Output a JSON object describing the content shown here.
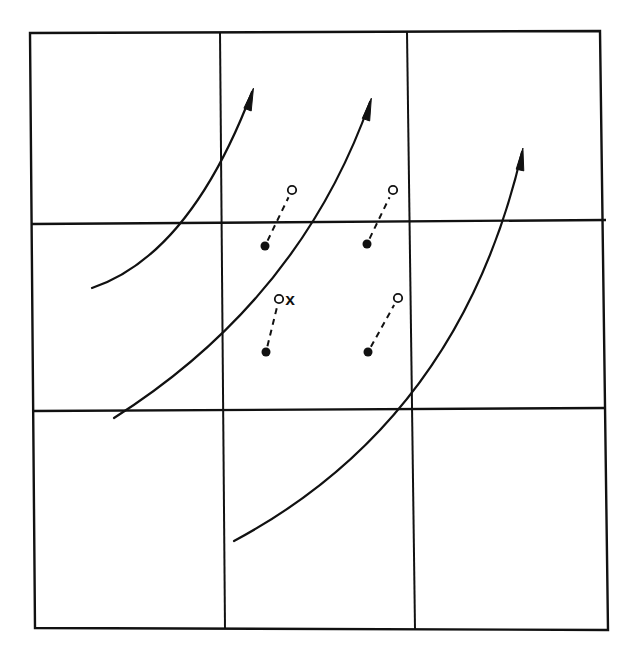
{
  "diagram": {
    "type": "grid-flow-displacement",
    "colors": {
      "ink": "#111111",
      "background": "#ffffff"
    },
    "grid": {
      "rows": 3,
      "cols": 3,
      "outer_box": {
        "x1": 30,
        "y1": 33,
        "x2": 604,
        "y2": 630
      },
      "vertical_lines": [
        {
          "x_top": 220,
          "x_bottom": 225
        },
        {
          "x_top": 407,
          "x_bottom": 415
        }
      ],
      "horizontal_lines": [
        {
          "y_left": 224,
          "y_right": 220
        },
        {
          "y_left": 411,
          "y_right": 408
        }
      ]
    },
    "flow_curves": [
      {
        "id": "curve-1",
        "start": [
          92,
          288
        ],
        "control": [
          190,
          255
        ],
        "end": [
          252,
          92
        ],
        "arrow": "end"
      },
      {
        "id": "curve-2",
        "start": [
          114,
          418
        ],
        "control": [
          300,
          300
        ],
        "end": [
          370,
          102
        ],
        "arrow": "end"
      },
      {
        "id": "curve-3",
        "start": [
          234,
          541
        ],
        "control": [
          460,
          420
        ],
        "end": [
          522,
          152
        ],
        "arrow": "end"
      }
    ],
    "displacement_pairs": [
      {
        "from_filled": [
          265,
          246
        ],
        "to_open": [
          292,
          190
        ],
        "label": ""
      },
      {
        "from_filled": [
          367,
          244
        ],
        "to_open": [
          393,
          190
        ],
        "label": ""
      },
      {
        "from_filled": [
          266,
          352
        ],
        "to_open": [
          279,
          299
        ],
        "label": "x"
      },
      {
        "from_filled": [
          368,
          352
        ],
        "to_open": [
          398,
          298
        ],
        "label": ""
      }
    ],
    "legend": {
      "filled_marker": "filled-dot",
      "open_marker": "open-circle",
      "connector": "dashed-line"
    }
  }
}
